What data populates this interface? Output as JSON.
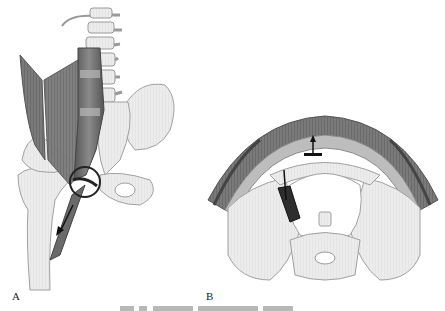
{
  "figure": {
    "panels": [
      {
        "id": "A",
        "label": "A",
        "subject": "psoas-iliacus-hip-illustration"
      },
      {
        "id": "B",
        "label": "B",
        "subject": "pelvis-transverse-section-illustration"
      }
    ],
    "caption_truncated": true
  },
  "colors": {
    "bone": "#e9e9e9",
    "bone_outline": "#9a9a9a",
    "muscle": "#6e6e6e",
    "muscle_dark": "#3e3e3e",
    "tissue": "#8c8c8c",
    "background": "#ffffff"
  }
}
